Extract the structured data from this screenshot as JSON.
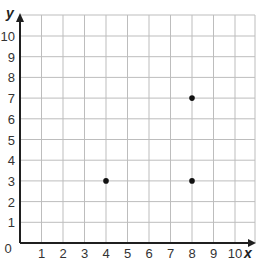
{
  "chart_data": {
    "type": "scatter",
    "title": "",
    "xlabel": "x",
    "ylabel": "y",
    "xlim": [
      0,
      10.9
    ],
    "ylim": [
      0,
      10.6
    ],
    "grid": true,
    "legend": null,
    "x_ticks": [
      0,
      1,
      2,
      3,
      4,
      5,
      6,
      7,
      8,
      9,
      10
    ],
    "y_ticks": [
      1,
      2,
      3,
      4,
      5,
      6,
      7,
      8,
      9,
      10
    ],
    "x_tick_labels": [
      "1",
      "2",
      "3",
      "4",
      "5",
      "6",
      "7",
      "8",
      "9",
      "10"
    ],
    "y_tick_labels": [
      "1",
      "2",
      "3",
      "4",
      "5",
      "6",
      "7",
      "8",
      "9",
      "10"
    ],
    "origin_label": "0",
    "series": [
      {
        "name": "points",
        "points": [
          {
            "x": 4,
            "y": 3
          },
          {
            "x": 8,
            "y": 3
          },
          {
            "x": 8,
            "y": 7
          }
        ]
      }
    ]
  },
  "layout": {
    "origin_px": [
      20,
      243
    ],
    "unit_x_px": 21.5,
    "unit_y_px": 20.7,
    "grid_right_px": 255,
    "grid_top_px": 15,
    "colors": {
      "grid": "#bdbdbd",
      "axis": "#1f1f1f",
      "point": "#111111",
      "text": "#333333"
    }
  }
}
